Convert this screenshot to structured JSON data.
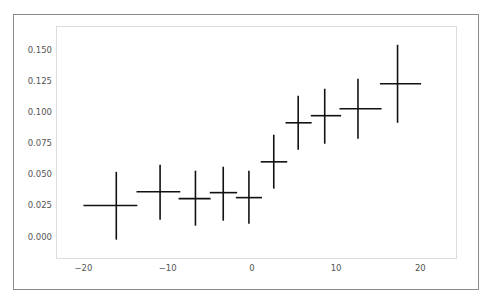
{
  "chart_data": {
    "type": "scatter",
    "subtype": "errorbar",
    "title": "",
    "xlabel": "",
    "ylabel": "",
    "xlim": [
      -23.2,
      24.3
    ],
    "ylim": [
      -0.0175,
      0.1685
    ],
    "xticks": [
      -20,
      -10,
      0,
      10,
      20
    ],
    "xtick_labels": [
      "−20",
      "−10",
      "0",
      "10",
      "20"
    ],
    "yticks": [
      0.0,
      0.025,
      0.05,
      0.075,
      0.1,
      0.125,
      0.15
    ],
    "ytick_labels": [
      "0.000",
      "0.025",
      "0.050",
      "0.075",
      "0.100",
      "0.125",
      "0.150"
    ],
    "grid": false,
    "legend": null,
    "color": "#111111",
    "points": [
      {
        "x": -16.1,
        "y": 0.025,
        "xmin": -20.0,
        "xmax": -13.6,
        "ymin": -0.0024,
        "ymax": 0.052
      },
      {
        "x": -10.9,
        "y": 0.036,
        "xmin": -13.7,
        "xmax": -8.5,
        "ymin": 0.0136,
        "ymax": 0.0577
      },
      {
        "x": -6.7,
        "y": 0.0305,
        "xmin": -8.7,
        "xmax": -4.9,
        "ymin": 0.0088,
        "ymax": 0.0529
      },
      {
        "x": -3.4,
        "y": 0.0353,
        "xmin": -5.0,
        "xmax": -1.75,
        "ymin": 0.0128,
        "ymax": 0.0561
      },
      {
        "x": -0.35,
        "y": 0.0313,
        "xmin": -1.9,
        "xmax": 1.2,
        "ymin": 0.0104,
        "ymax": 0.0529
      },
      {
        "x": 2.6,
        "y": 0.06,
        "xmin": 1.05,
        "xmax": 4.2,
        "ymin": 0.0385,
        "ymax": 0.0817
      },
      {
        "x": 5.5,
        "y": 0.0913,
        "xmin": 4.0,
        "xmax": 7.1,
        "ymin": 0.0697,
        "ymax": 0.113
      },
      {
        "x": 8.65,
        "y": 0.097,
        "xmin": 7.0,
        "xmax": 10.6,
        "ymin": 0.0745,
        "ymax": 0.1186
      },
      {
        "x": 12.6,
        "y": 0.1026,
        "xmin": 10.4,
        "xmax": 15.4,
        "ymin": 0.0785,
        "ymax": 0.1266
      },
      {
        "x": 17.3,
        "y": 0.1226,
        "xmin": 15.2,
        "xmax": 20.1,
        "ymin": 0.0913,
        "ymax": 0.1538
      }
    ]
  }
}
